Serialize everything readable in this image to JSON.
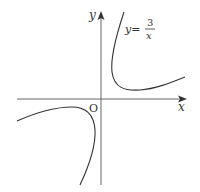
{
  "figure": {
    "x_axis_label": "x",
    "y_axis_label": "y",
    "origin_label": "O",
    "equation": {
      "lhs": "y=",
      "numerator": "3",
      "denominator": "x"
    },
    "colors": {
      "axis": "#555555",
      "curve": "#333333",
      "text": "#333333"
    }
  }
}
